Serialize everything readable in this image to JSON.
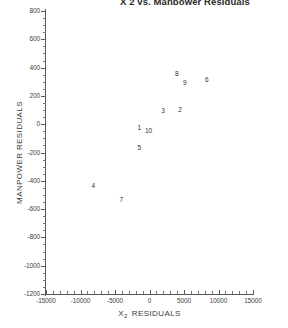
{
  "chart_data": {
    "type": "scatter",
    "title": "X 2 vs. Manpower Residuals",
    "xlabel": "X 2  RESIDUALS",
    "xlabel_base": "X",
    "xlabel_sub": "2",
    "xlabel_tail": "RESIDUALS",
    "ylabel": "MANPOWER RESIDUALS",
    "xlim": [
      -15000,
      15000
    ],
    "ylim": [
      -1200,
      800
    ],
    "xticks": [
      -15000,
      -10000,
      -5000,
      0,
      5000,
      10000,
      15000
    ],
    "xtick_labels": [
      "-15000",
      "-10000",
      "-5000",
      "0",
      "5000",
      "10000",
      "15000"
    ],
    "yticks": [
      -1200,
      -1000,
      -800,
      -600,
      -400,
      -200,
      0,
      200,
      400,
      600,
      800
    ],
    "ytick_labels": [
      "-1200",
      "-1000",
      "-800",
      "-600",
      "-400",
      "-200",
      "0",
      "200",
      "400",
      "600",
      "800"
    ],
    "x_minor_step": 1000,
    "y_minor_step": 50,
    "grid": false,
    "legend": "none",
    "marker_style": "numeric-label",
    "points": [
      {
        "label": "8",
        "x": 3950,
        "y": 363
      },
      {
        "label": "9",
        "x": 5100,
        "y": 299
      },
      {
        "label": "6",
        "x": 8300,
        "y": 320
      },
      {
        "label": "3",
        "x": 1950,
        "y": 101
      },
      {
        "label": "2",
        "x": 4400,
        "y": 108
      },
      {
        "label": "1",
        "x": -1500,
        "y": -21
      },
      {
        "label": "10",
        "x": -150,
        "y": -42
      },
      {
        "label": "5",
        "x": -1500,
        "y": -163
      },
      {
        "label": "4",
        "x": -8150,
        "y": -431
      },
      {
        "label": "7",
        "x": -4100,
        "y": -530
      }
    ]
  }
}
